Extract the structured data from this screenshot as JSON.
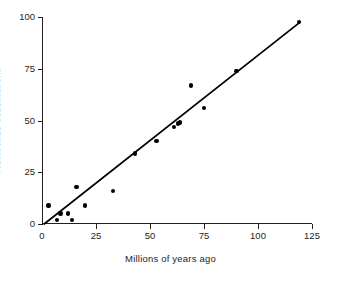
{
  "chart_data": {
    "type": "scatter",
    "title": "",
    "xlabel": "Millions of years ago",
    "ylabel": "Nucleotide substitutions",
    "xlim": [
      0,
      125
    ],
    "ylim": [
      0,
      100
    ],
    "xticks": [
      0,
      25,
      50,
      75,
      100,
      125
    ],
    "yticks": [
      0,
      25,
      50,
      75,
      100
    ],
    "xticklabels": [
      "0",
      "25",
      "50",
      "75",
      "100",
      "125"
    ],
    "yticklabels": [
      "0",
      "25",
      "50",
      "75",
      "100"
    ],
    "grid": false,
    "legend": null,
    "marker_color": "#000000",
    "line_color": "#000000",
    "points": [
      {
        "x": 3,
        "y": 9
      },
      {
        "x": 7,
        "y": 2
      },
      {
        "x": 8.5,
        "y": 5
      },
      {
        "x": 12,
        "y": 5
      },
      {
        "x": 14,
        "y": 2
      },
      {
        "x": 16,
        "y": 18
      },
      {
        "x": 20,
        "y": 9
      },
      {
        "x": 33,
        "y": 16
      },
      {
        "x": 43,
        "y": 34
      },
      {
        "x": 53,
        "y": 40
      },
      {
        "x": 61,
        "y": 47
      },
      {
        "x": 63,
        "y": 48.5
      },
      {
        "x": 64,
        "y": 49
      },
      {
        "x": 69,
        "y": 67
      },
      {
        "x": 75,
        "y": 56
      },
      {
        "x": 90,
        "y": 74
      },
      {
        "x": 119,
        "y": 97.5
      }
    ],
    "fit_line": {
      "name": "linear fit",
      "x1": 1,
      "y1": 0,
      "x2": 119.5,
      "y2": 97.5
    }
  }
}
